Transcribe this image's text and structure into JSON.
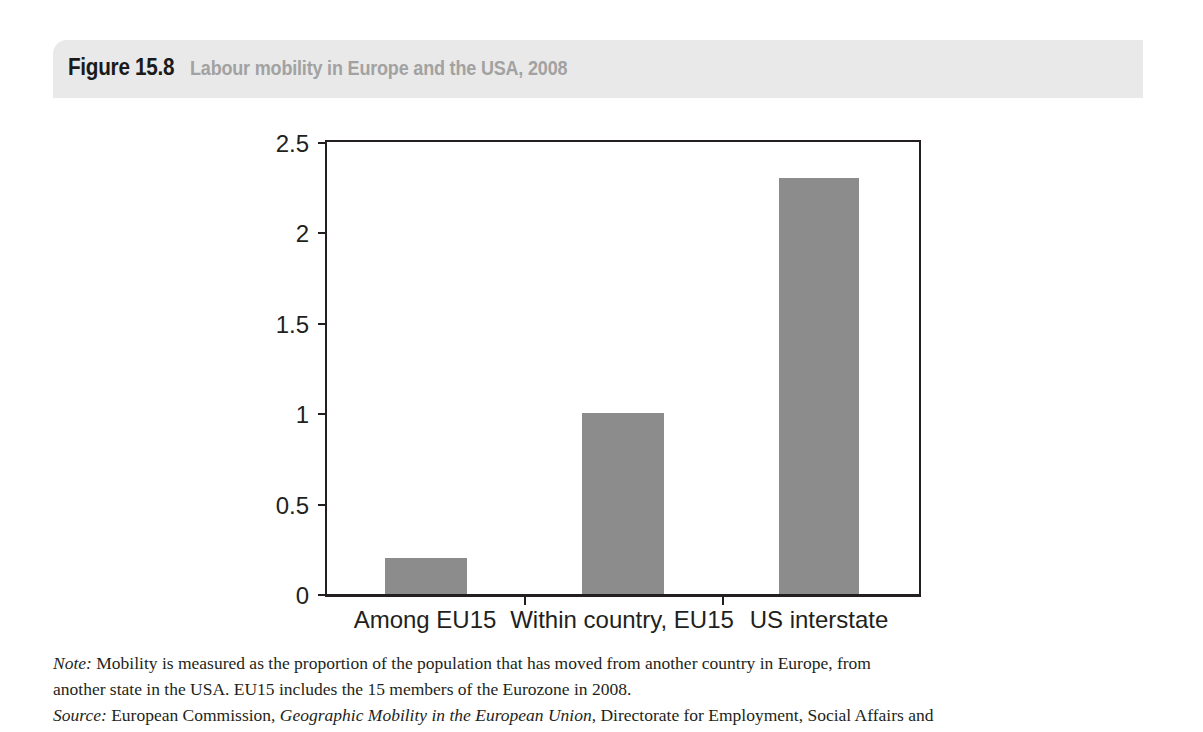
{
  "figure": {
    "number": "Figure 15.8",
    "caption": "Labour mobility in Europe and the USA, 2008",
    "header_bg": "#e9e9e9",
    "caption_color": "#a2a2a2"
  },
  "chart_data": {
    "type": "bar",
    "title": "Labour mobility in Europe and the USA, 2008",
    "categories": [
      "Among EU15",
      "Within country, EU15",
      "US interstate"
    ],
    "values": [
      0.2,
      1.0,
      2.3
    ],
    "xlabel": "",
    "ylabel": "",
    "ylim": [
      0,
      2.5
    ],
    "yticks": [
      "0",
      "0.5",
      "1",
      "1.5",
      "2",
      "2.5"
    ],
    "ytick_values": [
      0,
      0.5,
      1,
      1.5,
      2,
      2.5
    ],
    "grid": false,
    "legend": false,
    "bar_color": "#8c8c8c",
    "axis_color": "#231f20"
  },
  "notes": {
    "note_label": "Note:",
    "note_line1": " Mobility is measured as the proportion of the population that has moved from another country in Europe, from",
    "note_line2": "another state in the USA. EU15 includes the 15 members of the Eurozone in 2008.",
    "source_label": "Source:",
    "source_pre": " European Commission, ",
    "source_italic": "Geographic Mobility in the European Union",
    "source_post": ", Directorate for Employment, Social Affairs and"
  }
}
